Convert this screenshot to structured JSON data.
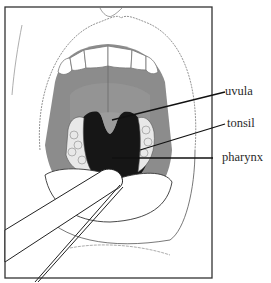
{
  "figure": {
    "labels": [
      {
        "id": "uvula",
        "text": "uvula"
      },
      {
        "id": "tonsil",
        "text": "tonsil"
      },
      {
        "id": "pharynx",
        "text": "pharynx"
      }
    ],
    "colors": {
      "frame": "#333333",
      "throat_dark": "#1a1a1a",
      "palate_gray": "#8a8a8a",
      "line": "#222222"
    }
  }
}
